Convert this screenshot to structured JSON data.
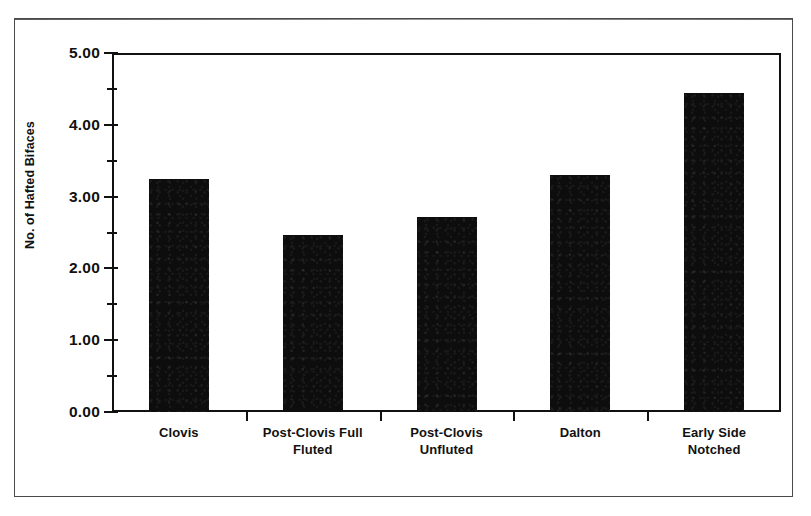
{
  "chart_data": {
    "type": "bar",
    "title": "",
    "xlabel": "",
    "ylabel": "No. of Hafted Bifaces",
    "categories": [
      "Clovis",
      "Post-Clovis Full Fluted",
      "Post-Clovis Unfluted",
      "Dalton",
      "Early Side Notched"
    ],
    "values": [
      3.25,
      2.46,
      2.72,
      3.3,
      4.44
    ],
    "ylim": [
      0.0,
      5.0
    ],
    "ytick_labels": [
      "0.00",
      "1.00",
      "2.00",
      "3.00",
      "4.00",
      "5.00"
    ],
    "ytick_values": [
      0.0,
      1.0,
      2.0,
      3.0,
      4.0,
      5.0
    ],
    "yminor_tick_values": [
      0.5,
      1.5,
      2.5,
      3.5,
      4.5
    ],
    "grid": false,
    "legend": false,
    "bar_color": "#0d0d0d",
    "axis_color": "#111111",
    "background_color": "#ffffff"
  },
  "category_label_lines": [
    [
      "Clovis"
    ],
    [
      "Post-Clovis Full",
      "Fluted"
    ],
    [
      "Post-Clovis",
      "Unfluted"
    ],
    [
      "Dalton"
    ],
    [
      "Early Side",
      "Notched"
    ]
  ]
}
